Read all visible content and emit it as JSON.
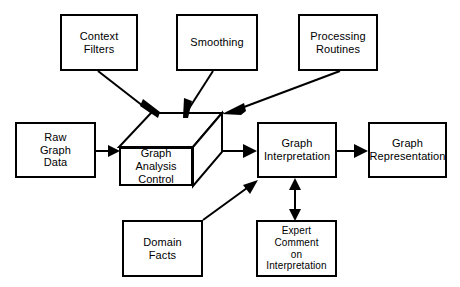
{
  "diagram": {
    "type": "block-flow-diagram",
    "background_color": "#ffffff",
    "line_color": "#000000",
    "text_color": "#000000",
    "nodes": {
      "context_filters": {
        "label": "Context\nFilters",
        "shape": "rectangle",
        "x": 60,
        "y": 14,
        "w": 78,
        "h": 57
      },
      "smoothing": {
        "label": "Smoothing",
        "shape": "rectangle",
        "x": 176,
        "y": 14,
        "w": 82,
        "h": 57
      },
      "processing_routines": {
        "label": "Processing\nRoutines",
        "shape": "rectangle",
        "x": 298,
        "y": 14,
        "w": 80,
        "h": 57
      },
      "raw_graph_data": {
        "label": "Raw\nGraph\nData",
        "shape": "rectangle",
        "x": 15,
        "y": 122,
        "w": 81,
        "h": 56
      },
      "graph_analysis_control": {
        "label": "Graph\nAnalysis\nControl",
        "shape": "cube",
        "x": 119,
        "y": 147,
        "w": 74,
        "h": 39
      },
      "graph_interpretation": {
        "label": "Graph\nInterpretation",
        "shape": "rectangle",
        "x": 257,
        "y": 122,
        "w": 80,
        "h": 56
      },
      "graph_representation": {
        "label": "Graph\nRepresentation",
        "shape": "rectangle",
        "x": 368,
        "y": 122,
        "w": 79,
        "h": 56
      },
      "domain_facts": {
        "label": "Domain\nFacts",
        "shape": "rectangle",
        "x": 122,
        "y": 220,
        "w": 81,
        "h": 57
      },
      "expert_comment": {
        "label": "Expert\nComment\non\nInterpretation",
        "shape": "rectangle",
        "x": 256,
        "y": 220,
        "w": 81,
        "h": 57
      }
    },
    "edges": [
      {
        "name": "context-filters-to-control",
        "from": "context_filters",
        "to": "graph_analysis_control",
        "arrow": "single"
      },
      {
        "name": "smoothing-to-control",
        "from": "smoothing",
        "to": "graph_analysis_control",
        "arrow": "single"
      },
      {
        "name": "processing-routines-to-control",
        "from": "processing_routines",
        "to": "graph_analysis_control",
        "arrow": "single"
      },
      {
        "name": "raw-graph-data-to-control",
        "from": "raw_graph_data",
        "to": "graph_analysis_control",
        "arrow": "single"
      },
      {
        "name": "control-to-interpretation",
        "from": "graph_analysis_control",
        "to": "graph_interpretation",
        "arrow": "single"
      },
      {
        "name": "interpretation-to-representation",
        "from": "graph_interpretation",
        "to": "graph_representation",
        "arrow": "single"
      },
      {
        "name": "domain-facts-to-interpretation",
        "from": "domain_facts",
        "to": "graph_interpretation",
        "arrow": "single"
      },
      {
        "name": "interpretation-expert-comment",
        "from": "graph_interpretation",
        "to": "expert_comment",
        "arrow": "double"
      }
    ]
  }
}
